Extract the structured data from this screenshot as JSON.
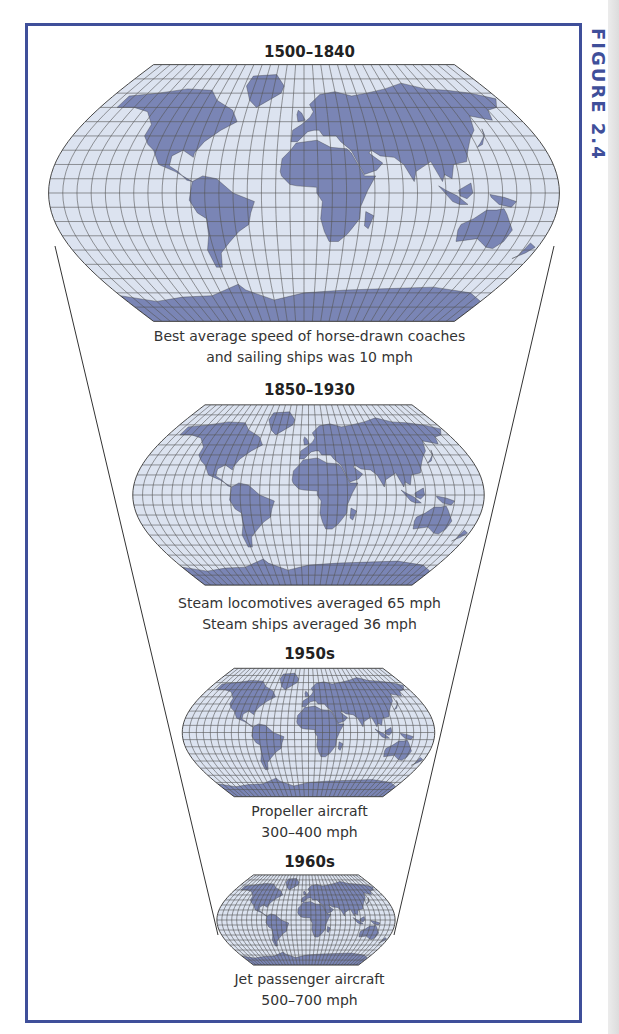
{
  "figure": {
    "label": "FIGURE 2.4",
    "frame_color": "#3f4f9a",
    "ocean_color": "#dce3f0",
    "land_color": "#7a85b5"
  },
  "eras": [
    {
      "period": "1500–1840",
      "caption_lines": [
        "Best average speed of horse-drawn coaches",
        "and sailing ships was 10 mph"
      ]
    },
    {
      "period": "1850–1930",
      "caption_lines": [
        "Steam locomotives averaged 65 mph",
        "Steam ships averaged 36 mph"
      ]
    },
    {
      "period": "1950s",
      "caption_lines": [
        "Propeller aircraft",
        "300–400 mph"
      ]
    },
    {
      "period": "1960s",
      "caption_lines": [
        "Jet passenger aircraft",
        "500–700 mph"
      ]
    }
  ]
}
